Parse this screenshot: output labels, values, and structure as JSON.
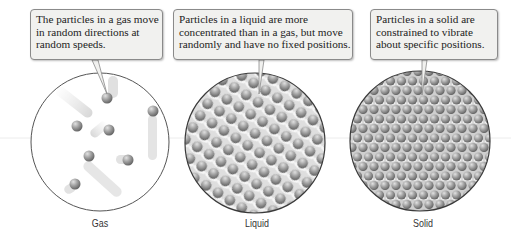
{
  "diagram": {
    "panels": [
      {
        "id": "gas",
        "label": "Gas",
        "callout": {
          "lines": [
            "The particles in a gas move",
            "in random directions at",
            "random speeds."
          ]
        },
        "particle_count": 8,
        "arrangement": "sparse, random with motion trails"
      },
      {
        "id": "liquid",
        "label": "Liquid",
        "callout": {
          "lines": [
            "Particles in a liquid are more",
            "concentrated than in a gas, but move",
            "randomly and have no fixed positions."
          ]
        },
        "arrangement": "dense, irregular diagonal rows"
      },
      {
        "id": "solid",
        "label": "Solid",
        "callout": {
          "lines": [
            "Particles in a solid are",
            "constrained to vibrate",
            "about specific positions."
          ]
        },
        "arrangement": "close-packed regular lattice"
      }
    ],
    "colors": {
      "particle": "#8d8d8d",
      "particle_highlight": "#d8d8d8",
      "circle_outline": "#444444",
      "callout_fill": "#f1f1ef",
      "callout_border": "#8a8a8a",
      "background": "#ffffff"
    }
  }
}
